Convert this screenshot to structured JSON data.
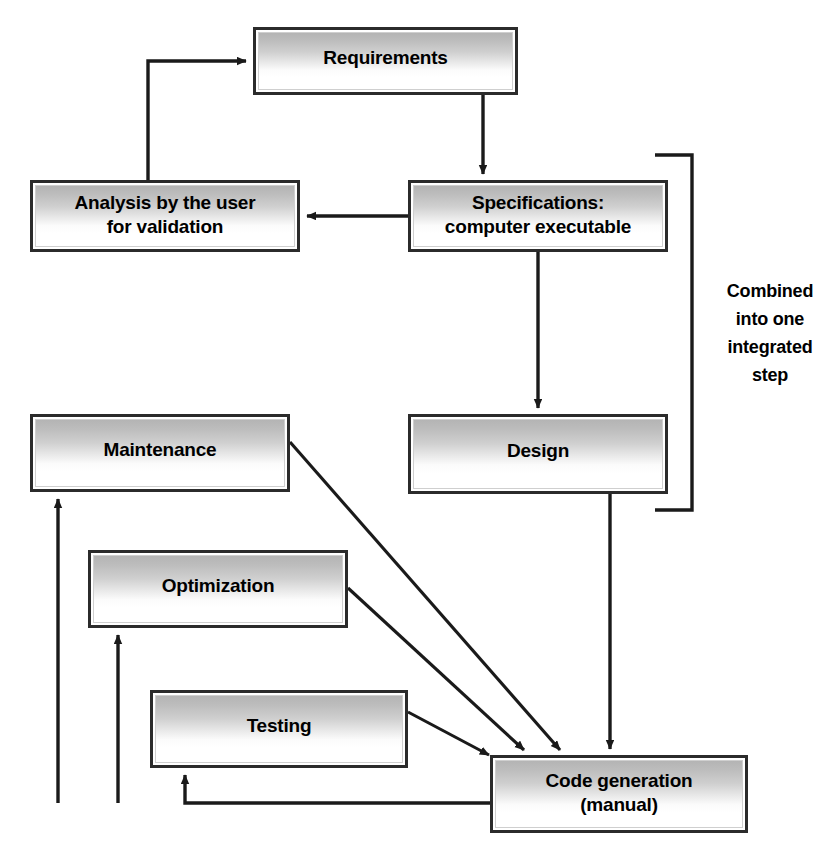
{
  "diagram": {
    "background_color": "#ffffff",
    "line_color": "#1a1a1a",
    "box_border_color": "#2b2b2b",
    "box_fill_top": "#b4b4b4",
    "box_fill_bottom": "#ffffff",
    "nodes": [
      {
        "id": "requirements",
        "label": "Requirements",
        "x": 253,
        "y": 27,
        "w": 265,
        "h": 68
      },
      {
        "id": "analysis",
        "label": "Analysis by the user\nfor validation",
        "x": 30,
        "y": 180,
        "w": 270,
        "h": 72
      },
      {
        "id": "specifications",
        "label": "Specifications:\ncomputer executable",
        "x": 408,
        "y": 180,
        "w": 260,
        "h": 72
      },
      {
        "id": "design",
        "label": "Design",
        "x": 408,
        "y": 414,
        "w": 260,
        "h": 80
      },
      {
        "id": "maintenance",
        "label": "Maintenance",
        "x": 30,
        "y": 414,
        "w": 260,
        "h": 78
      },
      {
        "id": "optimization",
        "label": "Optimization",
        "x": 88,
        "y": 550,
        "w": 260,
        "h": 78
      },
      {
        "id": "testing",
        "label": "Testing",
        "x": 150,
        "y": 690,
        "w": 258,
        "h": 78
      },
      {
        "id": "code-generation",
        "label": "Code generation\n(manual)",
        "x": 490,
        "y": 755,
        "w": 258,
        "h": 78
      }
    ],
    "annotations": [
      {
        "id": "combined-note",
        "text": "Combined\ninto one\nintegrated\nstep",
        "x": 706,
        "y": 278,
        "w": 128
      }
    ]
  }
}
